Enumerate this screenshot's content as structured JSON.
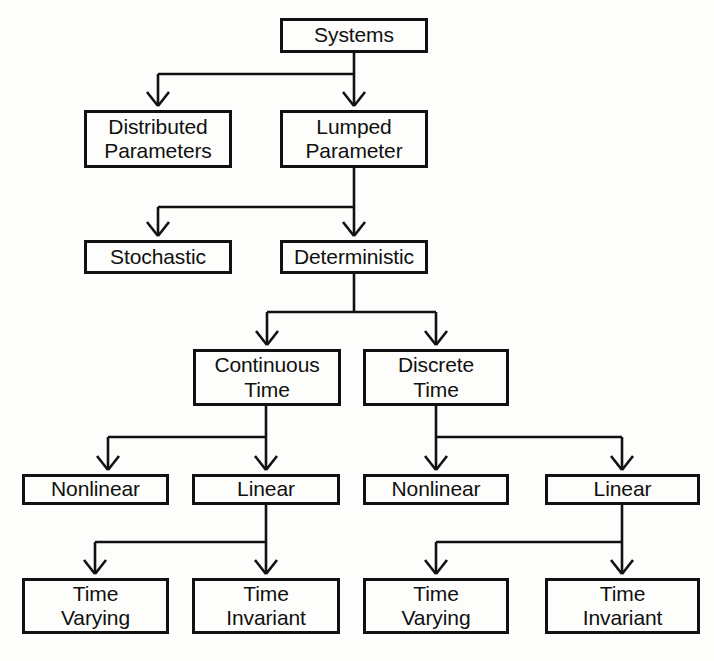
{
  "diagram": {
    "style": {
      "box_border_color": "#111111",
      "box_fill_color": "#fdfdfb",
      "edge_color": "#111111",
      "text_color": "#101010",
      "background_color": "#fdfdfb"
    },
    "nodes": [
      {
        "id": "systems",
        "label": "Systems",
        "x": 280,
        "y": 18,
        "w": 148,
        "h": 35
      },
      {
        "id": "distributed",
        "label": "Distributed\nParameters",
        "x": 84,
        "y": 110,
        "w": 148,
        "h": 58
      },
      {
        "id": "lumped",
        "label": "Lumped\nParameter",
        "x": 280,
        "y": 110,
        "w": 148,
        "h": 58
      },
      {
        "id": "stochastic",
        "label": "Stochastic",
        "x": 84,
        "y": 240,
        "w": 148,
        "h": 34
      },
      {
        "id": "deterministic",
        "label": "Deterministic",
        "x": 280,
        "y": 240,
        "w": 148,
        "h": 34
      },
      {
        "id": "continuous-time",
        "label": "Continuous\nTime",
        "x": 193,
        "y": 349,
        "w": 148,
        "h": 57
      },
      {
        "id": "discrete-time",
        "label": "Discrete\nTime",
        "x": 363,
        "y": 349,
        "w": 146,
        "h": 57
      },
      {
        "id": "ct-nonlinear",
        "label": "Nonlinear",
        "x": 22,
        "y": 474,
        "w": 147,
        "h": 31
      },
      {
        "id": "ct-linear",
        "label": "Linear",
        "x": 192,
        "y": 474,
        "w": 148,
        "h": 31
      },
      {
        "id": "dt-nonlinear",
        "label": "Nonlinear",
        "x": 363,
        "y": 474,
        "w": 146,
        "h": 31
      },
      {
        "id": "dt-linear",
        "label": "Linear",
        "x": 545,
        "y": 474,
        "w": 155,
        "h": 31
      },
      {
        "id": "ct-time-varying",
        "label": "Time\nVarying",
        "x": 22,
        "y": 578,
        "w": 147,
        "h": 56
      },
      {
        "id": "ct-time-invariant",
        "label": "Time\nInvariant",
        "x": 192,
        "y": 578,
        "w": 148,
        "h": 56
      },
      {
        "id": "dt-time-varying",
        "label": "Time\nVarying",
        "x": 363,
        "y": 578,
        "w": 146,
        "h": 56
      },
      {
        "id": "dt-time-invariant",
        "label": "Time\nInvariant",
        "x": 545,
        "y": 578,
        "w": 155,
        "h": 56
      }
    ],
    "edges": [
      {
        "from": "systems",
        "to": "distributed",
        "kind": "elbow-left"
      },
      {
        "from": "systems",
        "to": "lumped",
        "kind": "straight-down"
      },
      {
        "from": "lumped",
        "to": "stochastic",
        "kind": "elbow-left"
      },
      {
        "from": "lumped",
        "to": "deterministic",
        "kind": "straight-down"
      },
      {
        "from": "deterministic",
        "to": "continuous-time",
        "kind": "elbow-left"
      },
      {
        "from": "deterministic",
        "to": "discrete-time",
        "kind": "elbow-right"
      },
      {
        "from": "continuous-time",
        "to": "ct-nonlinear",
        "kind": "elbow-left"
      },
      {
        "from": "continuous-time",
        "to": "ct-linear",
        "kind": "straight-down"
      },
      {
        "from": "discrete-time",
        "to": "dt-nonlinear",
        "kind": "straight-down"
      },
      {
        "from": "discrete-time",
        "to": "dt-linear",
        "kind": "elbow-right"
      },
      {
        "from": "ct-linear",
        "to": "ct-time-varying",
        "kind": "elbow-left"
      },
      {
        "from": "ct-linear",
        "to": "ct-time-invariant",
        "kind": "straight-down"
      },
      {
        "from": "dt-linear",
        "to": "dt-time-varying",
        "kind": "elbow-left"
      },
      {
        "from": "dt-linear",
        "to": "dt-time-invariant",
        "kind": "straight-down"
      }
    ],
    "edge_paths": [
      {
        "name": "systems-to-branch",
        "d": "M 354,53 L 354,74"
      },
      {
        "name": "systems-branch-bar",
        "d": "M 158,74 L 354,74"
      },
      {
        "name": "to-distributed",
        "d": "M 158,74 L 158,104"
      },
      {
        "name": "to-lumped",
        "d": "M 354,74 L 354,104"
      },
      {
        "name": "lumped-to-branch",
        "d": "M 354,168 L 354,207"
      },
      {
        "name": "lumped-branch-bar",
        "d": "M 158,207 L 354,207"
      },
      {
        "name": "to-stochastic",
        "d": "M 158,207 L 158,234"
      },
      {
        "name": "to-deterministic",
        "d": "M 354,207 L 354,234"
      },
      {
        "name": "determ-to-branch",
        "d": "M 354,274 L 354,312"
      },
      {
        "name": "determ-branch-bar",
        "d": "M 267,312 L 436,312"
      },
      {
        "name": "to-continuous",
        "d": "M 267,312 L 267,343"
      },
      {
        "name": "to-discrete",
        "d": "M 436,312 L 436,343"
      },
      {
        "name": "continuous-to-branch",
        "d": "M 266,406 L 266,437"
      },
      {
        "name": "continuous-branch-bar",
        "d": "M 108,437 L 266,437"
      },
      {
        "name": "to-ct-nonlinear",
        "d": "M 108,437 L 108,468"
      },
      {
        "name": "to-ct-linear",
        "d": "M 266,437 L 266,468"
      },
      {
        "name": "discrete-to-branch",
        "d": "M 436,406 L 436,437"
      },
      {
        "name": "discrete-branch-bar",
        "d": "M 436,437 L 622,437"
      },
      {
        "name": "to-dt-nonlinear",
        "d": "M 436,437 L 436,468"
      },
      {
        "name": "to-dt-linear",
        "d": "M 622,437 L 622,468"
      },
      {
        "name": "ct-linear-to-branch",
        "d": "M 266,505 L 266,542"
      },
      {
        "name": "ct-linear-branch-bar",
        "d": "M 95,542 L 266,542"
      },
      {
        "name": "to-ct-time-varying",
        "d": "M 95,542 L 95,572"
      },
      {
        "name": "to-ct-time-invariant",
        "d": "M 266,542 L 266,572"
      },
      {
        "name": "dt-linear-to-branch",
        "d": "M 622,505 L 622,542"
      },
      {
        "name": "dt-linear-branch-bar",
        "d": "M 436,542 L 622,542"
      },
      {
        "name": "to-dt-time-varying",
        "d": "M 436,542 L 436,572"
      },
      {
        "name": "to-dt-time-invariant",
        "d": "M 622,542 L 622,572"
      }
    ],
    "arrowheads": [
      {
        "name": "arrow-distributed",
        "x": 158,
        "y": 106
      },
      {
        "name": "arrow-lumped",
        "x": 354,
        "y": 106
      },
      {
        "name": "arrow-stochastic",
        "x": 158,
        "y": 236
      },
      {
        "name": "arrow-deterministic",
        "x": 354,
        "y": 236
      },
      {
        "name": "arrow-continuous",
        "x": 267,
        "y": 345
      },
      {
        "name": "arrow-discrete",
        "x": 436,
        "y": 345
      },
      {
        "name": "arrow-ct-nonlinear",
        "x": 108,
        "y": 470
      },
      {
        "name": "arrow-ct-linear",
        "x": 266,
        "y": 470
      },
      {
        "name": "arrow-dt-nonlinear",
        "x": 436,
        "y": 470
      },
      {
        "name": "arrow-dt-linear",
        "x": 622,
        "y": 470
      },
      {
        "name": "arrow-ct-time-varying",
        "x": 95,
        "y": 574
      },
      {
        "name": "arrow-ct-time-invar",
        "x": 266,
        "y": 574
      },
      {
        "name": "arrow-dt-time-varying",
        "x": 436,
        "y": 574
      },
      {
        "name": "arrow-dt-time-invar",
        "x": 622,
        "y": 574
      }
    ]
  }
}
